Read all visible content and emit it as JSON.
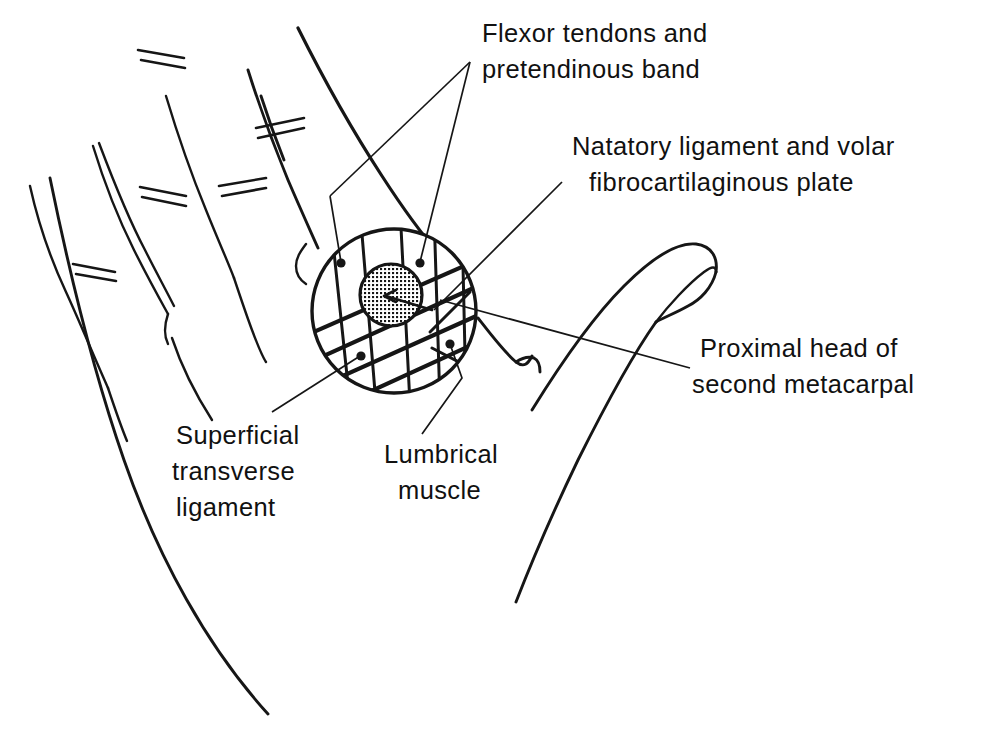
{
  "figure": {
    "kind": "anatomical-line-drawing",
    "background_color": "#ffffff",
    "ink_color": "#161616"
  },
  "labels": [
    {
      "id": "flexor-tendons",
      "lines": [
        "Flexor tendons and",
        "pretendinous band"
      ],
      "anchor_x": 482,
      "anchor_y": 42,
      "line_height": 36,
      "align": "start"
    },
    {
      "id": "natatory-ligament",
      "lines": [
        "Natatory ligament and volar",
        "fibrocartilaginous plate"
      ],
      "anchor_x": 572,
      "anchor_y": 155,
      "line_height": 36,
      "align": "start"
    },
    {
      "id": "proximal-head",
      "lines": [
        "Proximal head of",
        "second metacarpal"
      ],
      "anchor_x": 700,
      "anchor_y": 357,
      "line_height": 36,
      "align": "start"
    },
    {
      "id": "superficial-transverse-ligament",
      "lines": [
        "Superficial",
        "transverse",
        "ligament"
      ],
      "anchor_x": 176,
      "anchor_y": 444,
      "line_height": 36,
      "align": "start"
    },
    {
      "id": "lumbrical-muscle",
      "lines": [
        "Lumbrical",
        "muscle"
      ],
      "anchor_x": 384,
      "anchor_y": 463,
      "line_height": 36,
      "align": "start"
    }
  ],
  "inset": {
    "circle": {
      "cx": 394,
      "cy": 311,
      "r": 84
    },
    "plate": {
      "cx": 391,
      "cy": 295,
      "r": 31,
      "fill": "stipple-grid"
    }
  }
}
